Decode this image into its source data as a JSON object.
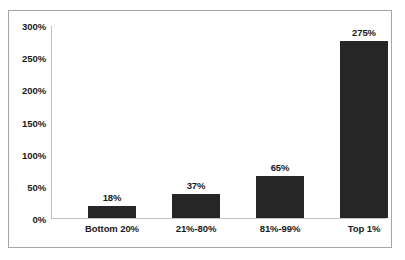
{
  "chart_data": {
    "type": "bar",
    "title": "",
    "subtitle": "",
    "xlabel": "",
    "ylabel": "",
    "categories": [
      "Bottom 20%",
      "21%-80%",
      "81%-99%",
      "Top 1%"
    ],
    "values": [
      18,
      37,
      65,
      275
    ],
    "value_labels": [
      "18%",
      "37%",
      "65%",
      "275%"
    ],
    "ylim": [
      0,
      300
    ],
    "y_ticks": [
      0,
      50,
      100,
      150,
      200,
      250,
      300
    ],
    "y_tick_labels": [
      "0%",
      "50%",
      "100%",
      "150%",
      "200%",
      "250%",
      "300%"
    ],
    "grid": false,
    "legend": null,
    "legend_position": "none",
    "annotations": [],
    "colors": {
      "bar_fill": "#262626",
      "axis_line": "#bfbfbf",
      "frame_border": "#a6a6a6",
      "plot_background": "#ffffff",
      "text": "#1a1a1a"
    }
  }
}
